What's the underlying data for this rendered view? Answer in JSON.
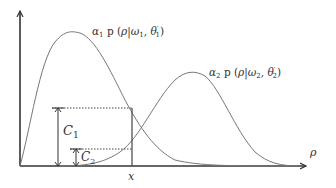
{
  "diagram": {
    "type": "mixture-density-illustration",
    "axes": {
      "x_label": "ρ",
      "x_marker_label": "x"
    },
    "curves": [
      {
        "name": "component-1",
        "label": "α₁ p (ρ|ω₁, θ′₁)",
        "label_parts": {
          "coef": "α",
          "coef_sub": "1",
          "p": " p (",
          "rho": "ρ",
          "bar": "|",
          "omega": "ω",
          "omega_sub": "1",
          "comma": ", ",
          "theta": "θ",
          "theta_prime": "′",
          "theta_sub": "1",
          "close": ")"
        }
      },
      {
        "name": "component-2",
        "label": "α₂ p (ρ|ω₂, θ′₂)",
        "label_parts": {
          "coef": "α",
          "coef_sub": "2",
          "p": " p (",
          "rho": "ρ",
          "bar": "|",
          "omega": "ω",
          "omega_sub": "2",
          "comma": ", ",
          "theta": "θ",
          "theta_prime": "′",
          "theta_sub": "2",
          "close": ")"
        }
      }
    ],
    "brackets": [
      {
        "name": "C1",
        "label": "C",
        "sub": "1"
      },
      {
        "name": "C2",
        "label": "C",
        "sub": "2"
      }
    ],
    "colors": {
      "axis": "#333333",
      "curve": "#777777",
      "dotted": "#444444"
    }
  }
}
